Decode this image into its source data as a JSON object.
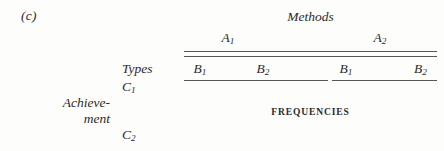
{
  "figure": {
    "panel_letter": "(c)",
    "background_color": "#fdfdfc",
    "rule_color": "#54565a",
    "text_color": "#2b2b2b"
  },
  "row_stub": {
    "factor_label_line1": "Achieve-",
    "factor_label_line2": "ment",
    "types_label": "Types",
    "levels": [
      {
        "base": "C",
        "subscript": "1"
      },
      {
        "base": "C",
        "subscript": "2"
      }
    ]
  },
  "column_head": {
    "spanner": "Methods",
    "a_levels": [
      {
        "base": "A",
        "subscript": "1"
      },
      {
        "base": "A",
        "subscript": "2"
      }
    ],
    "b_levels": [
      {
        "base": "B",
        "subscript": "1"
      },
      {
        "base": "B",
        "subscript": "2"
      },
      {
        "base": "B",
        "subscript": "1"
      },
      {
        "base": "B",
        "subscript": "2"
      }
    ]
  },
  "body": {
    "cell_content_caption": "FREQUENCIES"
  },
  "chart_data": {
    "type": "table",
    "title": "Methods",
    "caption": "(c)",
    "body_note": "FREQUENCIES",
    "row_factor": "Achievement",
    "row_factor_sublabel": "Types",
    "row_categories": [
      "C1",
      "C2"
    ],
    "column_factors": [
      "Methods",
      "Types"
    ],
    "column_spanner_categories": [
      "A1",
      "A2"
    ],
    "column_subcategories": [
      "B1",
      "B2",
      "B1",
      "B2"
    ],
    "values": [],
    "grid": false,
    "legend": "none"
  }
}
